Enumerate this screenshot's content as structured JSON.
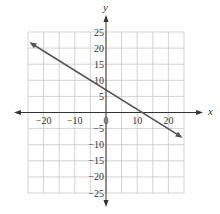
{
  "chart_data": {
    "type": "line",
    "title": "",
    "xlabel": "x",
    "ylabel": "y",
    "xlim": [
      -25,
      25
    ],
    "ylim": [
      -25,
      25
    ],
    "grid": true,
    "grid_step": 5,
    "x_ticks": [
      -20,
      -10,
      0,
      10,
      20
    ],
    "x_tick_labels": [
      "−20",
      "−10",
      "0",
      "10",
      "20"
    ],
    "y_ticks": [
      25,
      20,
      15,
      10,
      5,
      -5,
      -10,
      -15,
      -20,
      -25
    ],
    "y_tick_labels": [
      "25",
      "20",
      "15",
      "10",
      "5",
      "−5",
      "−10",
      "−15",
      "−20",
      "−25"
    ],
    "series": [
      {
        "name": "line",
        "x": [
          -24,
          24
        ],
        "y": [
          21.5,
          -7.5
        ],
        "y_intercept": 7,
        "x_intercept": 11.7,
        "slope": -0.6,
        "color": "#555555",
        "arrows": "both"
      }
    ],
    "legend": null
  },
  "colors": {
    "grid": "#c8c8c8",
    "axis": "#333333",
    "line": "#555555"
  }
}
